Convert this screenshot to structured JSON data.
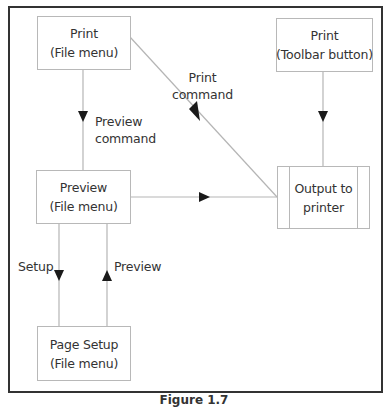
{
  "diagram": {
    "nodes": {
      "print_file": {
        "line1": "Print",
        "line2": "(File menu)"
      },
      "print_toolbar": {
        "line1": "Print",
        "line2": "(Toolbar button)"
      },
      "preview_file": {
        "line1": "Preview",
        "line2": "(File menu)"
      },
      "output_printer": {
        "line1": "Output to",
        "line2": "printer"
      },
      "page_setup": {
        "line1": "Page Setup",
        "line2": "(File menu)"
      }
    },
    "edges": [
      {
        "from": "print_file",
        "to": "preview_file",
        "label_line1": "Preview",
        "label_line2": "command"
      },
      {
        "from": "print_file",
        "to": "output_printer",
        "label_line1": "Print",
        "label_line2": "command"
      },
      {
        "from": "print_toolbar",
        "to": "output_printer",
        "label": ""
      },
      {
        "from": "preview_file",
        "to": "output_printer",
        "label": ""
      },
      {
        "from": "preview_file",
        "to": "page_setup",
        "label": "Setup"
      },
      {
        "from": "page_setup",
        "to": "preview_file",
        "label": "Preview"
      }
    ],
    "caption": "Figure 1.7"
  },
  "colors": {
    "frame": "#333333",
    "box_border": "#b8b8b8",
    "line": "#b5b5b5",
    "arrowhead": "#1a1a1a",
    "text": "#333333"
  }
}
